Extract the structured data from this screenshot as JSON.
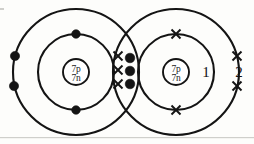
{
  "diagram": {
    "type": "dot-and-cross bonding diagram",
    "molecule": "N2",
    "ink_color": "#141414",
    "background_color": "#fdfdfb",
    "atoms": [
      {
        "id": "left-atom",
        "nucleus": {
          "protons_label": "7p",
          "neutrons_label": "7n",
          "cx": 76,
          "cy": 72,
          "r": 13
        },
        "electron_symbol": "dot",
        "shells": [
          {
            "name": "inner-shell",
            "r": 38,
            "electron_count": 2,
            "electrons": [
              {
                "x": 76,
                "y": 34
              },
              {
                "x": 76,
                "y": 110
              }
            ]
          },
          {
            "name": "outer-shell",
            "r": 63,
            "electron_count": 5,
            "electrons": [
              {
                "x": 15,
                "y": 56
              },
              {
                "x": 14,
                "y": 86
              },
              {
                "x": 130,
                "y": 58
              },
              {
                "x": 130,
                "y": 71
              },
              {
                "x": 130,
                "y": 84
              }
            ]
          }
        ]
      },
      {
        "id": "right-atom",
        "nucleus": {
          "protons_label": "7p",
          "neutrons_label": "7n",
          "cx": 176,
          "cy": 72,
          "r": 13
        },
        "electron_symbol": "cross",
        "shells": [
          {
            "name": "inner-shell",
            "r": 38,
            "electron_count": 2,
            "electrons": [
              {
                "x": 176,
                "y": 34
              },
              {
                "x": 176,
                "y": 110
              }
            ]
          },
          {
            "name": "outer-shell",
            "r": 63,
            "electron_count": 5,
            "electrons": [
              {
                "x": 118,
                "y": 56
              },
              {
                "x": 118,
                "y": 70
              },
              {
                "x": 118,
                "y": 84
              },
              {
                "x": 237,
                "y": 56
              },
              {
                "x": 237,
                "y": 86
              }
            ]
          }
        ]
      }
    ],
    "shell_labels": [
      {
        "id": "label-1",
        "text": "1",
        "x": 206,
        "y": 77
      },
      {
        "id": "label-2",
        "text": "2",
        "x": 239,
        "y": 77
      }
    ],
    "bonding_region": {
      "name": "shared-electron-overlap",
      "dot_count": 3,
      "cross_count": 3,
      "bond_type": "triple covalent bond"
    }
  }
}
